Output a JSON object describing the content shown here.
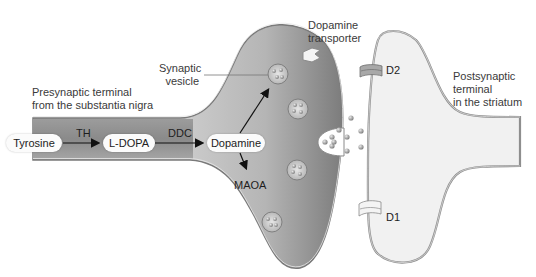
{
  "diagram": {
    "type": "neuron-synapse",
    "labels": {
      "presynaptic": [
        "Presynaptic terminal",
        "from the substantia nigra"
      ],
      "synaptic_vesicle": [
        "Synaptic",
        "vesicle"
      ],
      "dopamine_transporter": [
        "Dopamine",
        "transporter"
      ],
      "postsynaptic": [
        "Postsynaptic",
        "terminal",
        "in the striatum"
      ],
      "d2": "D2",
      "d1": "D1",
      "maoa": "MAOA"
    },
    "pathway": {
      "nodes": [
        "Tyrosine",
        "L-DOPA",
        "Dopamine"
      ],
      "enzymes": [
        "TH",
        "DDC"
      ]
    },
    "colors": {
      "presynaptic_fill": "#8e8e8e",
      "presynaptic_highlight": "#d8d8d8",
      "postsynaptic_fill": "#f2f2f2",
      "membrane": "#9a9a9a",
      "vesicle": "#cfcfcf",
      "text": "#333333"
    }
  }
}
